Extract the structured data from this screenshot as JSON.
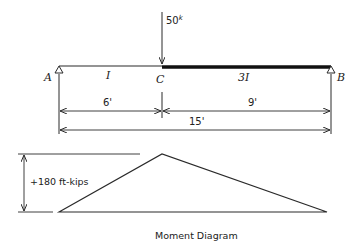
{
  "diagram": {
    "type": "beam_with_moment_diagram",
    "beam": {
      "supports": [
        {
          "label": "A",
          "type": "pin",
          "position_ft": 0
        },
        {
          "label": "B",
          "type": "pin",
          "position_ft": 15
        }
      ],
      "point_label": "C",
      "segments": [
        {
          "from": "A",
          "to": "C",
          "stiffness_label": "I"
        },
        {
          "from": "C",
          "to": "B",
          "stiffness_label": "3I"
        }
      ],
      "load": {
        "label": "50",
        "unit_symbol": "k",
        "position_ft": 6,
        "direction": "down"
      }
    },
    "dimensions": {
      "ac": "6'",
      "cb": "9'",
      "ab": "15'"
    },
    "moment_diagram": {
      "peak_label": "+180 ft-kips",
      "peak_position_ft": 6,
      "caption": "Moment Diagram"
    }
  },
  "colors": {
    "line": "#2a2a2a",
    "background": "#ffffff"
  }
}
